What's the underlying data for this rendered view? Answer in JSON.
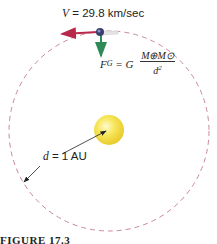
{
  "diagram": {
    "velocity_label": {
      "var": "V",
      "eq": " = ",
      "value": "29.8 km/sec"
    },
    "force_label": {
      "lhs": "F",
      "lhs_sub": "G",
      "eq": " = G ",
      "numerator": "M⊕M⊙",
      "denominator_base": "d",
      "denominator_exp": "2"
    },
    "distance_label": {
      "var": "d",
      "eq": " = ",
      "value": "1 AU"
    },
    "caption": "FIGURE 17.3",
    "colors": {
      "orbit": "#c98a96",
      "velocity_arrow": "#b8284a",
      "force_arrow": "#2e8b57",
      "sun": "#f3df3c",
      "sun_highlight": "#fff7b0",
      "earth": "#3a3f6e",
      "distance_arrow": "#222222"
    }
  }
}
